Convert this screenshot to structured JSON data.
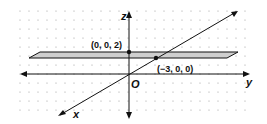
{
  "diagram": {
    "type": "3d-coordinate-plane",
    "axes": {
      "z_label": "z",
      "y_label": "y",
      "x_label": "x",
      "origin_label": "O"
    },
    "points": [
      {
        "label": "(0, 0, 2)"
      },
      {
        "label": "(−3, 0, 0)"
      }
    ],
    "plane": {
      "description": "horizontal plane through (0,0,2)",
      "fill": "#c8c8c8"
    },
    "colors": {
      "lines": "#111111",
      "grid_dots": "#9a9a9a"
    }
  }
}
